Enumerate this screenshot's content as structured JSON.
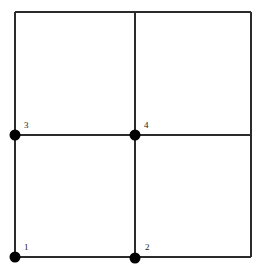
{
  "diagram": {
    "type": "mesh-grid",
    "background_color": "#ffffff",
    "line_color": "#2b2b2b",
    "node_color": "#000000",
    "label_color": "#1a1a1a",
    "bounds": {
      "left": 15,
      "top": 12,
      "right": 251,
      "bottom": 257
    },
    "lines": [
      {
        "name": "outer-top-edge",
        "x1": 15,
        "y1": 12,
        "x2": 251,
        "y2": 12
      },
      {
        "name": "outer-left-edge",
        "x1": 15,
        "y1": 12,
        "x2": 15,
        "y2": 257
      },
      {
        "name": "outer-right-edge",
        "x1": 251,
        "y1": 12,
        "x2": 251,
        "y2": 257
      },
      {
        "name": "outer-bottom-edge",
        "x1": 15,
        "y1": 257,
        "x2": 251,
        "y2": 257
      },
      {
        "name": "inner-vertical-line",
        "x1": 135,
        "y1": 12,
        "x2": 135,
        "y2": 257
      },
      {
        "name": "inner-horizontal-line",
        "x1": 15,
        "y1": 135,
        "x2": 251,
        "y2": 135
      }
    ],
    "nodes": [
      {
        "id": "node-1",
        "label": "1",
        "cx": 15,
        "cy": 257,
        "r": 5.5,
        "label_x": 24,
        "label_y": 243
      },
      {
        "id": "node-2",
        "label": "2",
        "cx": 135,
        "cy": 258,
        "r": 5.5,
        "label_x": 145,
        "label_y": 243
      },
      {
        "id": "node-3",
        "label": "3",
        "cx": 15,
        "cy": 135,
        "r": 5.5,
        "label_x": 24,
        "label_y": 121
      },
      {
        "id": "node-4",
        "label": "4",
        "cx": 135,
        "cy": 135,
        "r": 5.5,
        "label_x": 144,
        "label_y": 121
      }
    ]
  }
}
